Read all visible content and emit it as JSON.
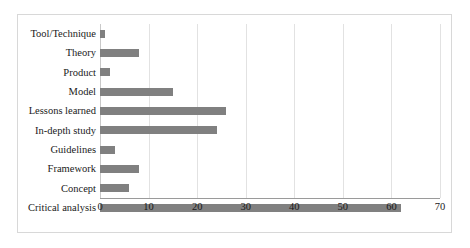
{
  "chart_data": {
    "type": "bar",
    "orientation": "horizontal",
    "title": "",
    "subtitle": "",
    "xlabel": "",
    "ylabel": "",
    "xlim": [
      0,
      70
    ],
    "xticks": [
      0,
      10,
      20,
      30,
      40,
      50,
      60,
      70
    ],
    "xtick_labels": [
      "0",
      "10",
      "20",
      "30",
      "40",
      "50",
      "60",
      "70"
    ],
    "grid": true,
    "grid_axis": "x",
    "legend": false,
    "legend_position": "none",
    "bar_color": "#808080",
    "categories": [
      "Tool/Technique",
      "Theory",
      "Product",
      "Model",
      "Lessons learned",
      "In-depth study",
      "Guidelines",
      "Framework",
      "Concept",
      "Critical analysis"
    ],
    "values": [
      1,
      8,
      2,
      15,
      26,
      24,
      3,
      8,
      6,
      62
    ]
  },
  "colors": {
    "bar": "#808080",
    "gridline": "#e2e2e2",
    "axis": "#9a9a9a",
    "frame": "#d8d8d8",
    "text": "#1a1a1a",
    "background": "#ffffff"
  }
}
